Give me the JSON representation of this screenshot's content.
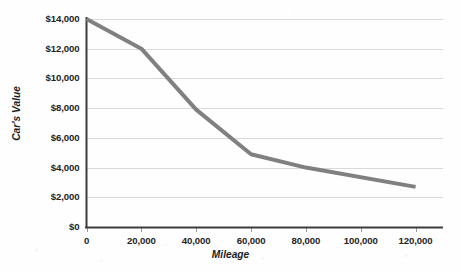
{
  "chart_data": {
    "type": "line",
    "title": "",
    "xlabel": "Mileage",
    "ylabel": "Car's Value",
    "xlim": [
      0,
      130000
    ],
    "ylim": [
      0,
      14000
    ],
    "grid": true,
    "legend": false,
    "legend_position": "none",
    "line_color": "#808080",
    "grid_color": "#d9d9d9",
    "axis_color": "#3c3c3c",
    "text_color": "#242424",
    "x": [
      0,
      20000,
      40000,
      60000,
      80000,
      120000
    ],
    "values": [
      14000,
      12000,
      7900,
      4900,
      4000,
      2700
    ],
    "series": [
      {
        "name": "Car's Value",
        "values": [
          14000,
          12000,
          7900,
          4900,
          4000,
          2700
        ]
      }
    ],
    "xticks": [
      0,
      20000,
      40000,
      60000,
      80000,
      100000,
      120000
    ],
    "xtick_labels": [
      "0",
      "20,000",
      "40,000",
      "60,000",
      "80,000",
      "100,000",
      "120,000"
    ],
    "yticks": [
      0,
      2000,
      4000,
      6000,
      8000,
      10000,
      12000,
      14000
    ],
    "ytick_labels": [
      "$0",
      "$2,000",
      "$4,000",
      "$6,000",
      "$8,000",
      "$10,000",
      "$12,000",
      "$14,000"
    ]
  }
}
